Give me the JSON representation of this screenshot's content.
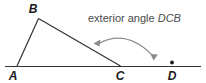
{
  "figure": {
    "caption": {
      "prefix": "exterior angle ",
      "angle_name": "DCB",
      "full": "exterior angle DCB"
    },
    "labels": {
      "a": "A",
      "b": "B",
      "c": "C",
      "d": "D"
    },
    "colors": {
      "line": "#333333",
      "arc": "#8c8c8c",
      "label": "#1a1a1a",
      "caption": "#4a4a4a",
      "background": "#ffffff"
    },
    "geometry": {
      "points": {
        "A": [
          17,
          66
        ],
        "B": [
          38,
          18
        ],
        "C": [
          120,
          66
        ],
        "D": [
          172,
          66
        ]
      },
      "baseline": [
        5,
        66,
        201,
        66
      ],
      "arc_start": [
        96,
        45
      ],
      "arc_end": [
        155,
        58
      ],
      "arc_peak": [
        126,
        33
      ],
      "d_marker": [
        172,
        62
      ]
    }
  }
}
